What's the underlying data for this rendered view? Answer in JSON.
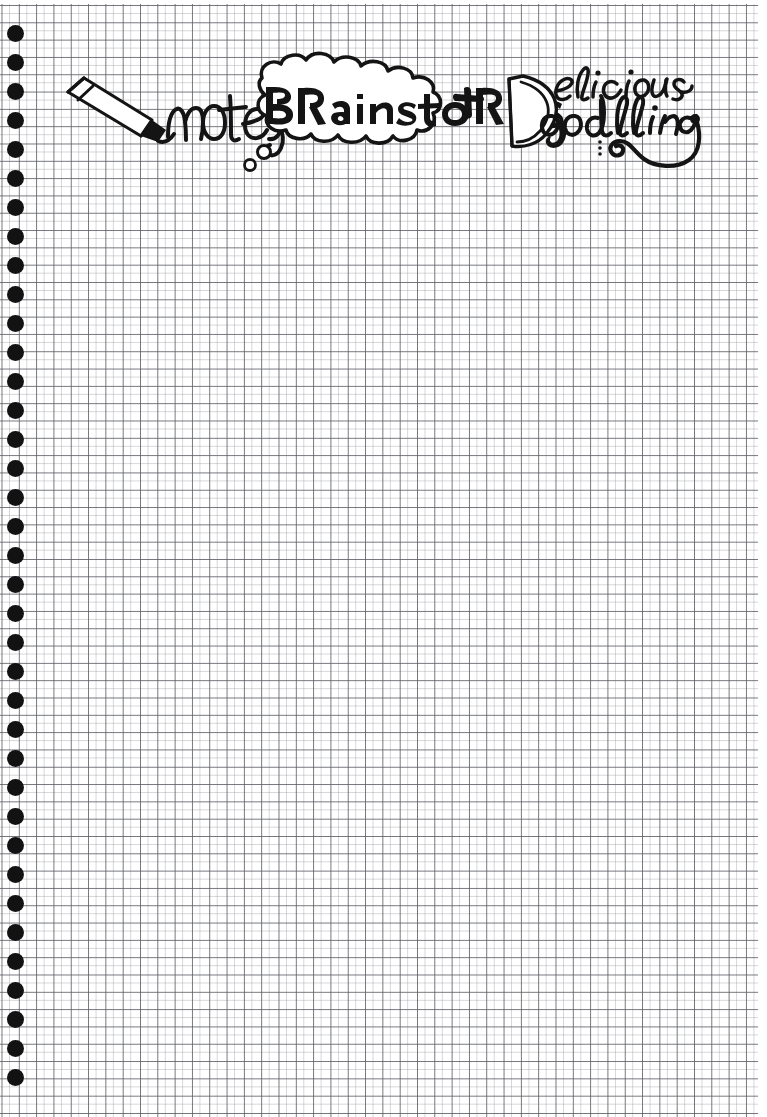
{
  "page": {
    "kind": "graph-paper-notebook-page",
    "width": 767,
    "height": 1117,
    "paper_color": "#ffffff",
    "grid_line_color": "#5a5c62",
    "grid_minor_color": "#96989e",
    "grid_cell_px": 17,
    "ink_color": "#141414"
  },
  "binding": {
    "name": "spiral-binding",
    "hole_color": "#121212",
    "hole_count": 37,
    "hole_diameter_px": 17,
    "hole_spacing_px": 29,
    "first_hole_y": 33,
    "hole_center_x": 15
  },
  "header": {
    "full_title": "notes BRainstoRMs + Delicious Doodling",
    "items": [
      {
        "id": "notes",
        "label": "notes",
        "style": "handwritten-cursive",
        "icon": "marker-pen-icon",
        "x": 118,
        "y": 115
      },
      {
        "id": "brainstorms",
        "label": "BRainstoRMs",
        "style": "hand-lettered-caps-mixed",
        "container": "thought-bubble",
        "x": 262,
        "y": 110
      },
      {
        "id": "plus",
        "label": "+",
        "style": "hand-drawn-plus",
        "x": 468,
        "y": 103
      },
      {
        "id": "delicious-doodling",
        "label": "Delicious Doodling",
        "line_one": "elicious",
        "line_two": "oodling",
        "shared_capital": "D",
        "style": "handwritten-script",
        "decoration": "spiral-flourish",
        "x": 505,
        "y": 78
      }
    ]
  },
  "decorations": {
    "thought_bubble_trail_circles": 2,
    "flourish": "spiral-swirl-under-doodling",
    "flourish_dots": 3
  },
  "body": {
    "content": "",
    "note": "blank ruled grid area"
  }
}
